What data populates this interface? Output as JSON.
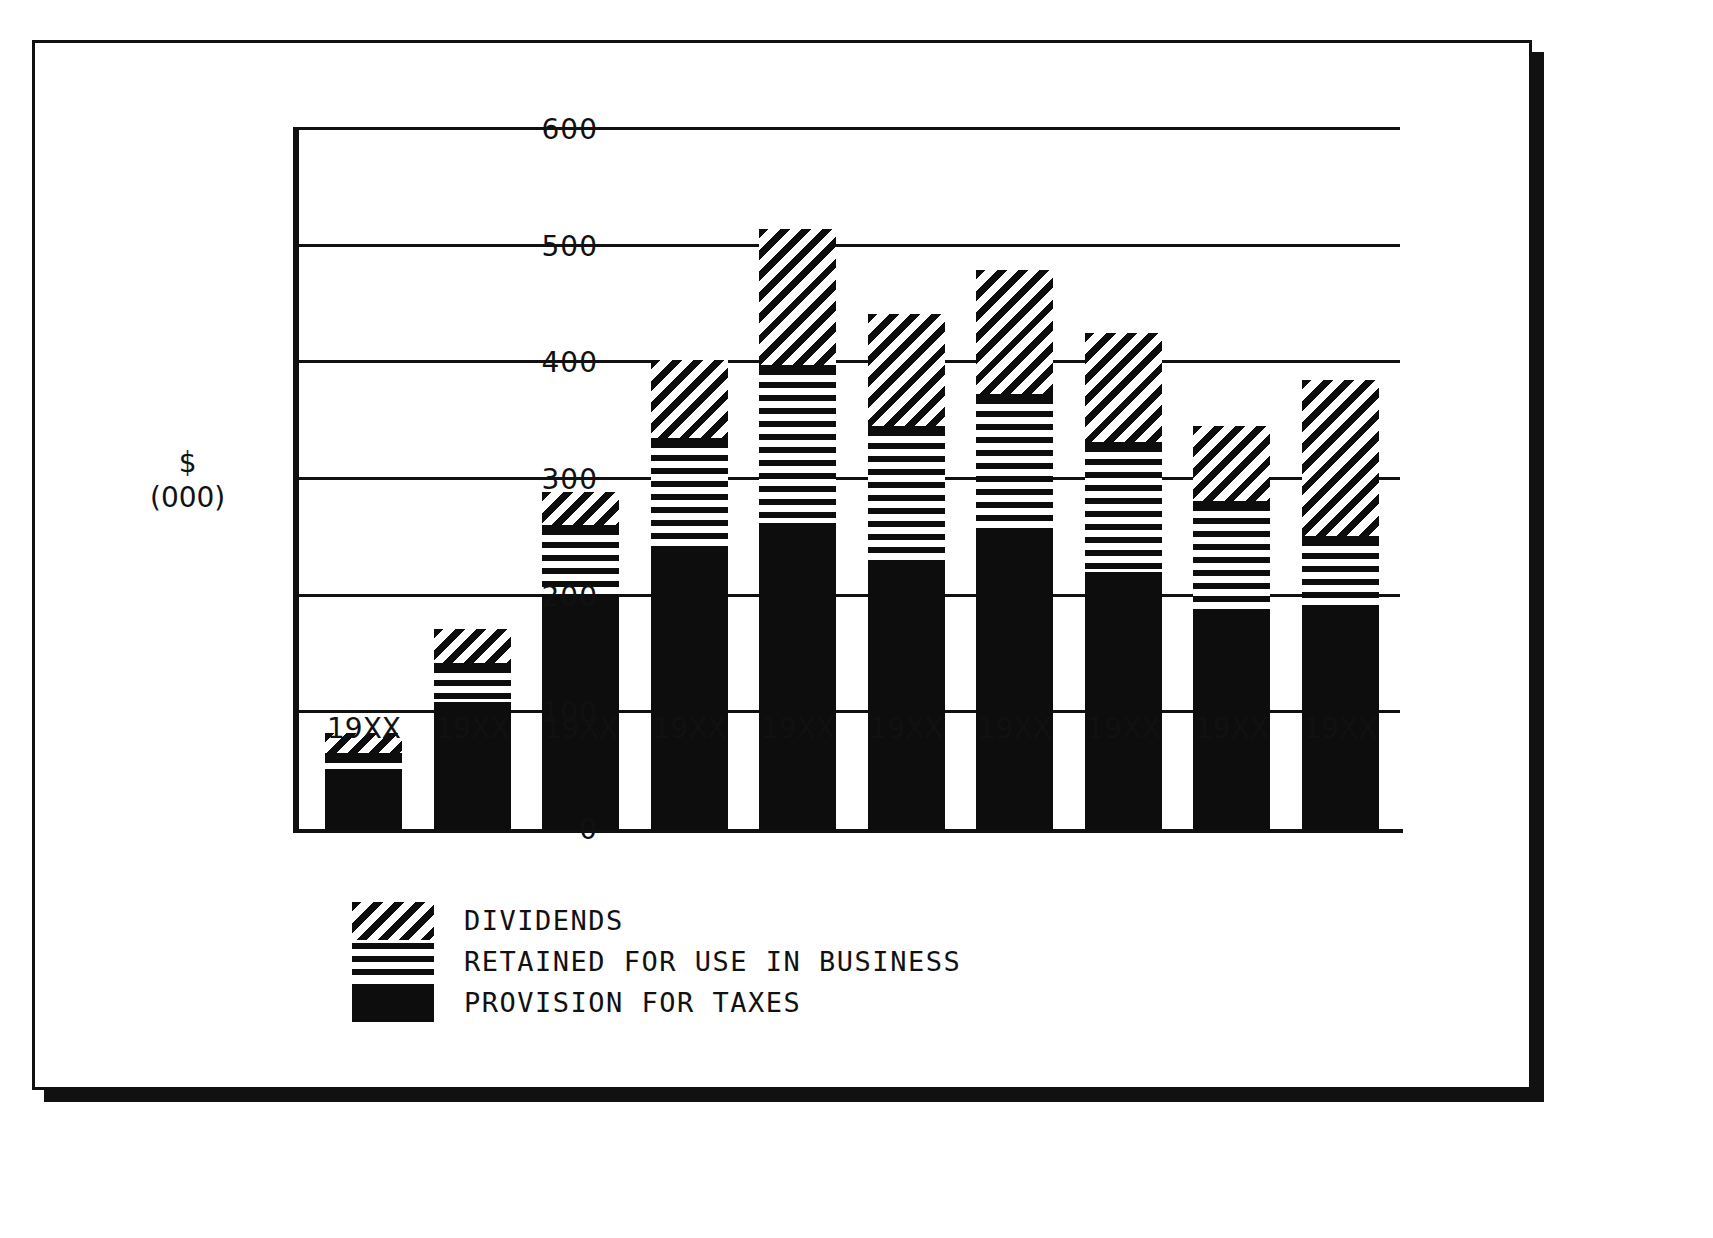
{
  "chart_data": {
    "type": "bar",
    "subtype": "stacked-bar",
    "title": "",
    "xlabel": "",
    "ylabel": "$\n(000)",
    "ylabel_lines": [
      "$",
      "(000)"
    ],
    "ylim": [
      0,
      600
    ],
    "yticks": [
      0,
      100,
      200,
      300,
      400,
      500,
      600
    ],
    "ytick_labels": [
      "0",
      "100",
      "200",
      "300",
      "400",
      "500",
      "600"
    ],
    "grid": true,
    "grid_axis": "y",
    "legend_position": "below-plot-left",
    "categories": [
      "19XX",
      "19XX",
      "19XX",
      "19XX",
      "19XX",
      "19XX",
      "19XX",
      "19XX",
      "19XX",
      "19XX"
    ],
    "series": [
      {
        "name": "PROVISION FOR TAXES",
        "pattern": "solid-black",
        "values": [
          50,
          107,
          196,
          240,
          261,
          226,
          253,
          219,
          183,
          189
        ]
      },
      {
        "name": "RETAINED FOR USE IN BUSINESS",
        "pattern": "horizontal-stripes",
        "values": [
          13,
          33,
          62,
          93,
          134,
          117,
          117,
          110,
          96,
          60
        ]
      },
      {
        "name": "DIVIDENDS",
        "pattern": "diagonal-stripes",
        "values": [
          20,
          32,
          32,
          70,
          120,
          99,
          110,
          97,
          67,
          137
        ]
      }
    ],
    "totals": [
      83,
      172,
      290,
      403,
      515,
      442,
      480,
      426,
      346,
      386
    ]
  },
  "legend": {
    "items": [
      {
        "label": "DIVIDENDS",
        "swatch": "diagonal-stripes"
      },
      {
        "label": "RETAINED FOR USE IN BUSINESS",
        "swatch": "horizontal-stripes"
      },
      {
        "label": "PROVISION FOR TAXES",
        "swatch": "solid-black"
      }
    ]
  },
  "colors": {
    "ink": "#111111",
    "fill": "#0d0d0d",
    "paper": "#ffffff"
  }
}
